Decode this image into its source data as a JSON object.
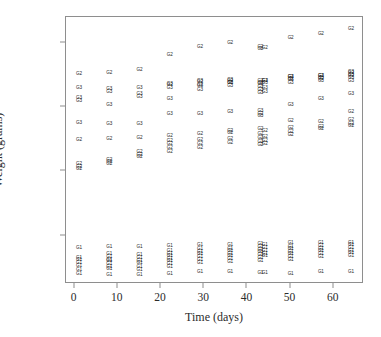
{
  "chart_data": {
    "type": "scatter",
    "title": "",
    "xlabel": "Time (days)",
    "ylabel": "Weight (grams)",
    "xlim": [
      -2,
      67
    ],
    "ylim": [
      225,
      640
    ],
    "grid": false,
    "legend": "none",
    "marker_style": "text-label",
    "group_labels": [
      "G1",
      "G2",
      "G3"
    ],
    "xticks": [
      0,
      10,
      20,
      30,
      40,
      50,
      60
    ],
    "xtick_labels": [
      "0",
      "10",
      "20",
      "30",
      "40",
      "50",
      "60"
    ],
    "yticks": [
      300,
      400,
      500,
      600
    ],
    "ytick_labels": [
      "300",
      "400",
      "500",
      "600"
    ],
    "series": [
      {
        "name": "G1",
        "label": "G1",
        "points": [
          [
            1,
            281
          ],
          [
            1,
            266
          ],
          [
            1,
            262
          ],
          [
            1,
            258
          ],
          [
            1,
            253
          ],
          [
            1,
            247
          ],
          [
            1,
            240
          ],
          [
            8,
            283
          ],
          [
            8,
            272
          ],
          [
            8,
            267
          ],
          [
            8,
            263
          ],
          [
            8,
            260
          ],
          [
            8,
            256
          ],
          [
            8,
            252
          ],
          [
            8,
            248
          ],
          [
            8,
            239
          ],
          [
            15,
            282
          ],
          [
            15,
            270
          ],
          [
            15,
            265
          ],
          [
            15,
            261
          ],
          [
            15,
            257
          ],
          [
            15,
            252
          ],
          [
            15,
            247
          ],
          [
            15,
            239
          ],
          [
            22,
            284
          ],
          [
            22,
            276
          ],
          [
            22,
            272
          ],
          [
            22,
            268
          ],
          [
            22,
            264
          ],
          [
            22,
            260
          ],
          [
            22,
            256
          ],
          [
            22,
            251
          ],
          [
            22,
            241
          ],
          [
            29,
            285
          ],
          [
            29,
            279
          ],
          [
            29,
            275
          ],
          [
            29,
            271
          ],
          [
            29,
            267
          ],
          [
            29,
            263
          ],
          [
            29,
            258
          ],
          [
            29,
            243
          ],
          [
            36,
            286
          ],
          [
            36,
            280
          ],
          [
            36,
            276
          ],
          [
            36,
            272
          ],
          [
            36,
            268
          ],
          [
            36,
            264
          ],
          [
            36,
            259
          ],
          [
            36,
            243
          ],
          [
            43,
            287
          ],
          [
            43,
            282
          ],
          [
            43,
            278
          ],
          [
            43,
            274
          ],
          [
            43,
            270
          ],
          [
            43,
            266
          ],
          [
            43,
            261
          ],
          [
            43,
            242
          ],
          [
            44,
            286
          ],
          [
            44,
            281
          ],
          [
            44,
            277
          ],
          [
            44,
            272
          ],
          [
            44,
            268
          ],
          [
            44,
            242
          ],
          [
            50,
            288
          ],
          [
            50,
            283
          ],
          [
            50,
            279
          ],
          [
            50,
            275
          ],
          [
            50,
            271
          ],
          [
            50,
            267
          ],
          [
            50,
            262
          ],
          [
            50,
            240
          ],
          [
            57,
            288
          ],
          [
            57,
            284
          ],
          [
            57,
            280
          ],
          [
            57,
            276
          ],
          [
            57,
            272
          ],
          [
            57,
            267
          ],
          [
            57,
            243
          ],
          [
            64,
            289
          ],
          [
            64,
            285
          ],
          [
            64,
            281
          ],
          [
            64,
            277
          ],
          [
            64,
            273
          ],
          [
            64,
            268
          ],
          [
            64,
            243
          ]
        ]
      },
      {
        "name": "G2",
        "label": "G2",
        "points": [
          [
            1,
            551
          ],
          [
            1,
            449
          ],
          [
            1,
            411
          ],
          [
            1,
            407
          ],
          [
            1,
            404
          ],
          [
            8,
            553
          ],
          [
            8,
            450
          ],
          [
            8,
            418
          ],
          [
            8,
            415
          ],
          [
            8,
            412
          ],
          [
            15,
            558
          ],
          [
            15,
            452
          ],
          [
            15,
            430
          ],
          [
            15,
            426
          ],
          [
            15,
            423
          ],
          [
            22,
            581
          ],
          [
            22,
            534
          ],
          [
            22,
            455
          ],
          [
            22,
            448
          ],
          [
            22,
            443
          ],
          [
            22,
            437
          ],
          [
            22,
            430
          ],
          [
            29,
            593
          ],
          [
            29,
            539
          ],
          [
            29,
            535
          ],
          [
            29,
            458
          ],
          [
            29,
            449
          ],
          [
            29,
            443
          ],
          [
            29,
            437
          ],
          [
            36,
            600
          ],
          [
            36,
            541
          ],
          [
            36,
            537
          ],
          [
            36,
            463
          ],
          [
            36,
            460
          ],
          [
            36,
            450
          ],
          [
            36,
            444
          ],
          [
            43,
            593
          ],
          [
            43,
            590
          ],
          [
            43,
            541
          ],
          [
            43,
            538
          ],
          [
            43,
            490
          ],
          [
            43,
            466
          ],
          [
            43,
            458
          ],
          [
            43,
            452
          ],
          [
            43,
            446
          ],
          [
            43,
            441
          ],
          [
            44,
            592
          ],
          [
            44,
            540
          ],
          [
            44,
            463
          ],
          [
            44,
            454
          ],
          [
            44,
            447
          ],
          [
            44,
            442
          ],
          [
            50,
            608
          ],
          [
            50,
            547
          ],
          [
            50,
            543
          ],
          [
            50,
            478
          ],
          [
            50,
            468
          ],
          [
            50,
            461
          ],
          [
            50,
            456
          ],
          [
            57,
            613
          ],
          [
            57,
            548
          ],
          [
            57,
            544
          ],
          [
            57,
            477
          ],
          [
            57,
            469
          ],
          [
            57,
            466
          ],
          [
            64,
            622
          ],
          [
            64,
            553
          ],
          [
            64,
            549
          ],
          [
            64,
            492
          ],
          [
            64,
            480
          ],
          [
            64,
            474
          ],
          [
            64,
            470
          ]
        ]
      },
      {
        "name": "G3",
        "label": "G3",
        "points": [
          [
            1,
            530
          ],
          [
            1,
            514
          ],
          [
            1,
            509
          ],
          [
            1,
            475
          ],
          [
            8,
            528
          ],
          [
            8,
            524
          ],
          [
            8,
            504
          ],
          [
            8,
            473
          ],
          [
            15,
            529
          ],
          [
            15,
            521
          ],
          [
            15,
            515
          ],
          [
            15,
            474
          ],
          [
            22,
            536
          ],
          [
            22,
            529
          ],
          [
            22,
            513
          ],
          [
            22,
            489
          ],
          [
            29,
            540
          ],
          [
            29,
            533
          ],
          [
            29,
            527
          ],
          [
            29,
            489
          ],
          [
            36,
            542
          ],
          [
            36,
            538
          ],
          [
            36,
            532
          ],
          [
            36,
            492
          ],
          [
            43,
            536
          ],
          [
            43,
            531
          ],
          [
            43,
            527
          ],
          [
            43,
            522
          ],
          [
            43,
            494
          ],
          [
            43,
            486
          ],
          [
            44,
            541
          ],
          [
            44,
            537
          ],
          [
            44,
            530
          ],
          [
            44,
            524
          ],
          [
            50,
            546
          ],
          [
            50,
            542
          ],
          [
            50,
            537
          ],
          [
            50,
            504
          ],
          [
            57,
            549
          ],
          [
            57,
            545
          ],
          [
            57,
            540
          ],
          [
            57,
            513
          ],
          [
            64,
            555
          ],
          [
            64,
            550
          ],
          [
            64,
            545
          ],
          [
            64,
            541
          ],
          [
            64,
            520
          ]
        ]
      }
    ]
  },
  "axes": {
    "x_title": "Time (days)",
    "y_title": "Weight (grams)"
  }
}
